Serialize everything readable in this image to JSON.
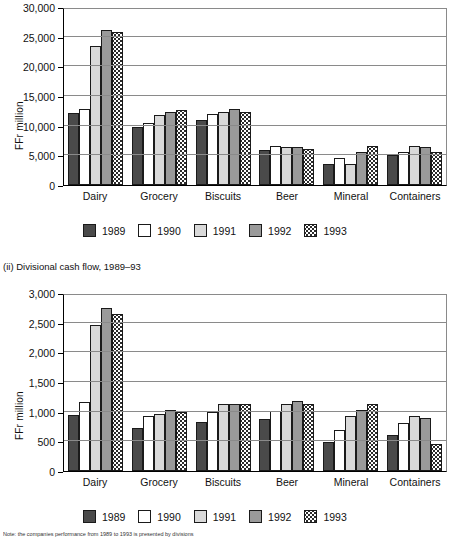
{
  "figure": {
    "ylabel": "FFr million",
    "subtitle_chart2": "(ii) Divisional cash flow, 1989–93",
    "note": "Note: the companies performance from 1989 to 1993 is presented by divisions",
    "legend": [
      {
        "year": "1989",
        "key": "c89",
        "color": "#4a4a4a"
      },
      {
        "year": "1990",
        "key": "c90",
        "color": "#ffffff"
      },
      {
        "year": "1991",
        "key": "c91",
        "color": "#d9d9d9"
      },
      {
        "year": "1992",
        "key": "c92",
        "color": "#9a9a9a"
      },
      {
        "year": "1993",
        "key": "c93",
        "color": "#ffffff"
      }
    ]
  },
  "chart_data": [
    {
      "type": "bar",
      "title": "",
      "xlabel": "",
      "ylabel": "FFr million",
      "ylim": [
        0,
        30000
      ],
      "yticks": [
        0,
        5000,
        10000,
        15000,
        20000,
        25000,
        30000
      ],
      "yticklabels": [
        "0",
        "5,000",
        "10,000",
        "15,000",
        "20,000",
        "25,000",
        "30,000"
      ],
      "grid": true,
      "legend_position": "below",
      "categories": [
        "Dairy",
        "Grocery",
        "Biscuits",
        "Beer",
        "Mineral",
        "Containers"
      ],
      "series": [
        {
          "name": "1989",
          "values": [
            12200,
            9900,
            11000,
            6000,
            3600,
            5200
          ]
        },
        {
          "name": "1990",
          "values": [
            13000,
            10600,
            12100,
            6600,
            4600,
            5700
          ]
        },
        {
          "name": "1991",
          "values": [
            23700,
            12000,
            12400,
            6550,
            3500,
            6700
          ]
        },
        {
          "name": "1992",
          "values": [
            26400,
            12400,
            12900,
            6400,
            5600,
            6400
          ]
        },
        {
          "name": "1993",
          "values": [
            26100,
            12750,
            12400,
            6150,
            6600,
            5700
          ]
        }
      ]
    },
    {
      "type": "bar",
      "title": "(ii) Divisional cash flow, 1989–93",
      "xlabel": "",
      "ylabel": "FFr million",
      "ylim": [
        0,
        3000
      ],
      "yticks": [
        0,
        500,
        1000,
        1500,
        2000,
        2500,
        3000
      ],
      "yticklabels": [
        "0",
        "500",
        "1,000",
        "1,500",
        "2,000",
        "2,500",
        "3,000"
      ],
      "grid": true,
      "legend_position": "below",
      "categories": [
        "Dairy",
        "Grocery",
        "Biscuits",
        "Beer",
        "Mineral",
        "Containers"
      ],
      "series": [
        {
          "name": "1989",
          "values": [
            960,
            740,
            830,
            880,
            490,
            620
          ]
        },
        {
          "name": "1990",
          "values": [
            1180,
            940,
            1000,
            1020,
            700,
            810
          ]
        },
        {
          "name": "1991",
          "values": [
            2490,
            980,
            1140,
            1140,
            930,
            940
          ]
        },
        {
          "name": "1992",
          "values": [
            2780,
            1040,
            1140,
            1200,
            1040,
            900
          ]
        },
        {
          "name": "1993",
          "values": [
            2680,
            1000,
            1140,
            1140,
            1140,
            460
          ]
        }
      ]
    }
  ]
}
